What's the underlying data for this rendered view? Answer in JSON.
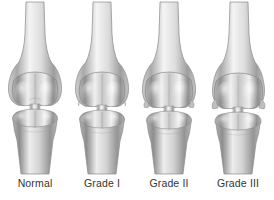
{
  "illustration": {
    "title": "Knee joint osteoarthritis severity grading",
    "view": "anterior",
    "background_color": "#ffffff",
    "ink_color": "#a8a8a8",
    "label_color": "#343434",
    "style": "grayscale medical line-and-tone illustration"
  },
  "figures": [
    {
      "label": "Normal",
      "joint_space": "wide and even",
      "joint_gap_px": 9,
      "medial_gap_px": 9,
      "lateral_gap_px": 9,
      "osteophytes": "none",
      "shaft_center_x": 34
    },
    {
      "label": "Grade I",
      "joint_space": "slight narrowing, possible osteophyte lipping",
      "joint_gap_px": 7,
      "medial_gap_px": 6,
      "lateral_gap_px": 7,
      "osteophytes": "minimal",
      "shaft_center_x": 34
    },
    {
      "label": "Grade II",
      "joint_space": "definite narrowing, medial predominance",
      "joint_gap_px": 5,
      "medial_gap_px": 3,
      "lateral_gap_px": 5,
      "osteophytes": "definite",
      "shaft_center_x": 34
    },
    {
      "label": "Grade III",
      "joint_space": "severe narrowing, near bone-on-bone",
      "joint_gap_px": 3,
      "medial_gap_px": 2,
      "lateral_gap_px": 3,
      "osteophytes": "multiple, moderate",
      "shaft_center_x": 34
    }
  ]
}
